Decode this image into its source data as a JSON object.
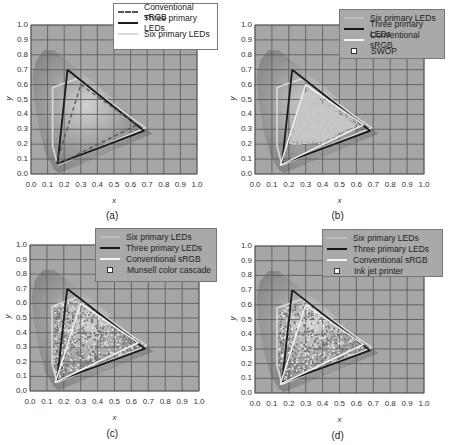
{
  "figure": {
    "panels": [
      {
        "id": "a",
        "caption": "(a)",
        "xlabel": "x",
        "ylabel": "y",
        "legend_style": "white",
        "legend": [
          {
            "label": "Conventional sRGB",
            "swatch": "srgb-dash"
          },
          {
            "label": "Three primary LEDs",
            "swatch": "three"
          },
          {
            "label": "Six primary LEDs",
            "swatch": "six"
          }
        ]
      },
      {
        "id": "b",
        "caption": "(b)",
        "xlabel": "x",
        "ylabel": "y",
        "legend_style": "gray",
        "legend": [
          {
            "label": "Six primary LEDs",
            "swatch": "blank"
          },
          {
            "label": "Three primary LEDs",
            "swatch": "three"
          },
          {
            "label": "Conventional sRGB",
            "swatch": "srgb-white"
          },
          {
            "label": "SWOP",
            "swatch": "marker"
          }
        ]
      },
      {
        "id": "c",
        "caption": "(c)",
        "xlabel": "x",
        "ylabel": "y",
        "legend_style": "gray",
        "legend": [
          {
            "label": "Six primary LEDs",
            "swatch": "blank"
          },
          {
            "label": "Three primary LEDs",
            "swatch": "three"
          },
          {
            "label": "Conventional sRGB",
            "swatch": "srgb-white"
          },
          {
            "label": "Munsell color cascade",
            "swatch": "marker"
          }
        ]
      },
      {
        "id": "d",
        "caption": "(d)",
        "xlabel": "x",
        "ylabel": "y",
        "legend_style": "gray",
        "legend": [
          {
            "label": "Six primary LEDs",
            "swatch": "blank"
          },
          {
            "label": "Three primary LEDs",
            "swatch": "three"
          },
          {
            "label": "Conventional sRGB",
            "swatch": "srgb-white"
          },
          {
            "label": "Ink jet printer",
            "swatch": "marker"
          }
        ]
      }
    ],
    "ticks": [
      "0.0",
      "0.1",
      "0.2",
      "0.3",
      "0.4",
      "0.5",
      "0.6",
      "0.7",
      "0.8",
      "0.9",
      "1.0"
    ],
    "colors": {
      "plot_bg": "#a6a6a6",
      "grid": "#555555",
      "three_primary": "#1a1a1a",
      "six_primary": "#d9d9d9",
      "srgb": "#f2f2f2",
      "spectral_locus_shade": "#8c8c8c"
    }
  },
  "chart_data": [
    {
      "panel": "(a)",
      "type": "line",
      "title": "",
      "xlabel": "x",
      "ylabel": "y",
      "xlim": [
        0.0,
        1.0
      ],
      "ylim": [
        0.0,
        1.0
      ],
      "grid": true,
      "legend_position": "upper right",
      "series": [
        {
          "name": "Conventional sRGB",
          "style": "dashed",
          "x": [
            0.3,
            0.64,
            0.15,
            0.3
          ],
          "y": [
            0.6,
            0.33,
            0.06,
            0.6
          ]
        },
        {
          "name": "Three primary LEDs",
          "style": "solid-dark",
          "x": [
            0.22,
            0.68,
            0.16,
            0.22
          ],
          "y": [
            0.7,
            0.29,
            0.07,
            0.7
          ]
        },
        {
          "name": "Six primary LEDs",
          "style": "solid-light",
          "x": [
            0.16,
            0.13,
            0.13,
            0.28,
            0.69,
            0.16
          ],
          "y": [
            0.06,
            0.19,
            0.58,
            0.64,
            0.31,
            0.06
          ]
        }
      ]
    },
    {
      "panel": "(b)",
      "type": "scatter",
      "xlabel": "x",
      "ylabel": "y",
      "xlim": [
        0.0,
        1.0
      ],
      "ylim": [
        0.0,
        1.0
      ],
      "grid": true,
      "legend_position": "upper right",
      "series": [
        {
          "name": "Six primary LEDs",
          "x": [
            0.16,
            0.13,
            0.13,
            0.28,
            0.69,
            0.16
          ],
          "y": [
            0.06,
            0.19,
            0.58,
            0.64,
            0.31,
            0.06
          ]
        },
        {
          "name": "Three primary LEDs",
          "x": [
            0.22,
            0.68,
            0.16,
            0.22
          ],
          "y": [
            0.7,
            0.29,
            0.07,
            0.7
          ]
        },
        {
          "name": "Conventional sRGB",
          "x": [
            0.3,
            0.64,
            0.15,
            0.3
          ],
          "y": [
            0.6,
            0.33,
            0.06,
            0.6
          ]
        },
        {
          "name": "SWOP",
          "x_range": [
            0.2,
            0.64
          ],
          "y_range": [
            0.2,
            0.56
          ],
          "note": "dense cloud of sample points"
        }
      ]
    },
    {
      "panel": "(c)",
      "type": "scatter",
      "xlabel": "x",
      "ylabel": "y",
      "xlim": [
        0.0,
        1.0
      ],
      "ylim": [
        0.0,
        1.0
      ],
      "grid": true,
      "legend_position": "upper right",
      "series": [
        {
          "name": "Six primary LEDs",
          "x": [
            0.16,
            0.13,
            0.13,
            0.28,
            0.69,
            0.16
          ],
          "y": [
            0.06,
            0.19,
            0.58,
            0.64,
            0.31,
            0.06
          ]
        },
        {
          "name": "Three primary LEDs",
          "x": [
            0.22,
            0.68,
            0.16,
            0.22
          ],
          "y": [
            0.7,
            0.29,
            0.07,
            0.7
          ]
        },
        {
          "name": "Conventional sRGB",
          "x": [
            0.3,
            0.64,
            0.15,
            0.3
          ],
          "y": [
            0.6,
            0.33,
            0.06,
            0.6
          ]
        },
        {
          "name": "Munsell color cascade",
          "x_range": [
            0.14,
            0.66
          ],
          "y_range": [
            0.07,
            0.64
          ],
          "note": "dense cloud of sample points"
        }
      ]
    },
    {
      "panel": "(d)",
      "type": "scatter",
      "xlabel": "x",
      "ylabel": "y",
      "xlim": [
        0.0,
        1.0
      ],
      "ylim": [
        0.0,
        1.0
      ],
      "grid": true,
      "legend_position": "upper right",
      "series": [
        {
          "name": "Six primary LEDs",
          "x": [
            0.16,
            0.13,
            0.13,
            0.28,
            0.69,
            0.16
          ],
          "y": [
            0.06,
            0.19,
            0.58,
            0.64,
            0.31,
            0.06
          ]
        },
        {
          "name": "Three primary LEDs",
          "x": [
            0.22,
            0.68,
            0.16,
            0.22
          ],
          "y": [
            0.7,
            0.29,
            0.07,
            0.7
          ]
        },
        {
          "name": "Conventional sRGB",
          "x": [
            0.3,
            0.64,
            0.15,
            0.3
          ],
          "y": [
            0.6,
            0.33,
            0.06,
            0.6
          ]
        },
        {
          "name": "Ink jet printer",
          "x_range": [
            0.14,
            0.66
          ],
          "y_range": [
            0.07,
            0.62
          ],
          "note": "dense cloud of sample points"
        }
      ]
    }
  ]
}
